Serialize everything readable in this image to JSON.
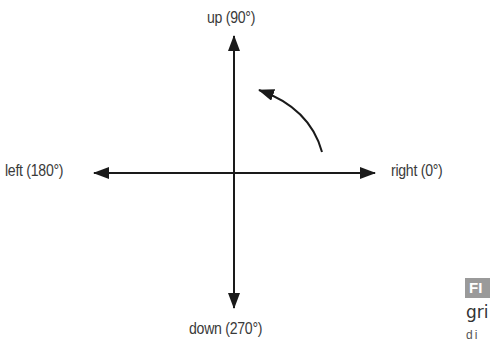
{
  "diagram": {
    "labels": {
      "up": "up (90°)",
      "down": "down (270°)",
      "left": "left (180°)",
      "right": "right (0°)"
    },
    "axes": [
      {
        "direction": "up",
        "angle_deg": 90
      },
      {
        "direction": "right",
        "angle_deg": 0
      },
      {
        "direction": "left",
        "angle_deg": 180
      },
      {
        "direction": "down",
        "angle_deg": 270
      }
    ],
    "rotation_arrow": {
      "direction": "counterclockwise"
    },
    "colors": {
      "lines": "#1a1a1a",
      "text": "#3a3a3a",
      "badge": "#9a9a9a"
    }
  },
  "cropped_caption": {
    "badge": "FI",
    "line1": "gri",
    "line2": "di"
  }
}
